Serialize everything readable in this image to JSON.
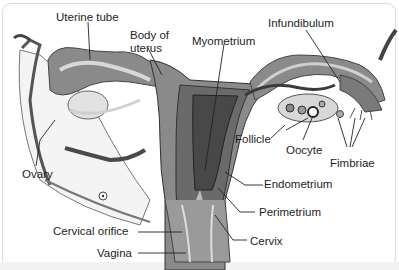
{
  "diagram": {
    "colors": {
      "uterus_outer": "#8a8a8a",
      "uterus_mid": "#6e6e6e",
      "uterus_inner": "#4a4a4a",
      "tube_light": "#b8b8b8",
      "ligament": "#f0f0f0",
      "line": "#222222",
      "frame_border": "#dcdcdc"
    },
    "labels": {
      "uterine_tube": "Uterine tube",
      "body_of_uterus_1": "Body of",
      "body_of_uterus_2": "uterus",
      "myometrium": "Myometrium",
      "infundibulum": "Infundibulum",
      "follicle": "Follicle",
      "oocyte": "Oocyte",
      "fimbriae": "Fimbriae",
      "ovary": "Ovary",
      "endometrium": "Endometrium",
      "perimetrium": "Perimetrium",
      "cervical_orifice": "Cervical orifice",
      "cervix": "Cervix",
      "vagina": "Vagina"
    }
  }
}
